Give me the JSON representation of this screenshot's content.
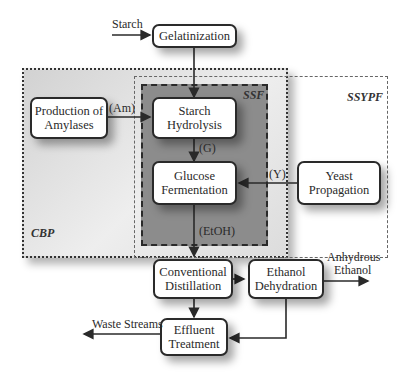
{
  "diagram": {
    "regions": {
      "cbp": "CBP",
      "ssypf": "SSYPF",
      "ssf": "SSF"
    },
    "nodes": {
      "gelatinization": "Gelatinization",
      "production_amylases_1": "Production of",
      "production_amylases_2": "Amylases",
      "starch_hydrolysis_1": "Starch",
      "starch_hydrolysis_2": "Hydrolysis",
      "glucose_fermentation_1": "Glucose",
      "glucose_fermentation_2": "Fermentation",
      "yeast_propagation_1": "Yeast",
      "yeast_propagation_2": "Propagation",
      "conventional_distillation_1": "Conventional",
      "conventional_distillation_2": "Distillation",
      "ethanol_dehydration_1": "Ethanol",
      "ethanol_dehydration_2": "Dehydration",
      "effluent_treatment_1": "Effluent",
      "effluent_treatment_2": "Treatment"
    },
    "edge_labels": {
      "starch": "Starch",
      "am": "(Am)",
      "g": "(G)",
      "y": "(Y)",
      "etoh": "(EtOH)",
      "anhydrous_1": "Anhydrous",
      "anhydrous_2": "Ethanol",
      "waste": "Waste Streams"
    },
    "colors": {
      "cbp_fill": "#d6d6d6",
      "ssf_fill": "#8c8c8c",
      "line": "#2a2a2a"
    }
  }
}
